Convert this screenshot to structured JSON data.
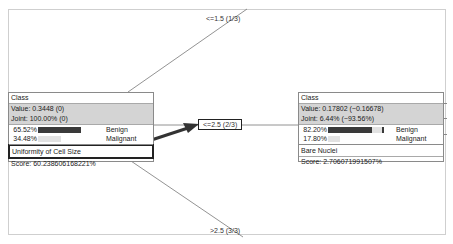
{
  "root_node": {
    "class_label": "Class",
    "value": "Value: 0.3448 (0)",
    "joint": "Joint: 100.00% (0)",
    "distribution": [
      {
        "pct": "65.52%",
        "label": "Benign",
        "fraction": 0.6552,
        "color": "#3a3a3a"
      },
      {
        "pct": "34.48%",
        "label": "Malignant",
        "fraction": 0.3448,
        "color": "#e2e2e2"
      }
    ],
    "split_attribute": "Uniformity of Cell Size",
    "score": "Score: 60.238606168221%"
  },
  "child_node": {
    "class_label": "Class",
    "value": "Value: 0.17802 (−0.16678)",
    "joint": "Joint: 6.44% (−93.56%)",
    "distribution": [
      {
        "pct": "82.20%",
        "label": "Benign",
        "fraction": 0.822,
        "color": "#3a3a3a"
      },
      {
        "pct": "17.80%",
        "label": "Malignant",
        "fraction": 0.178,
        "color": "#e2e2e2"
      }
    ],
    "split_attribute": "Bare Nuclei",
    "score": "Score: 2.706071991507%"
  },
  "edges": [
    {
      "label": "<=1.5 (1/3)",
      "selected": false
    },
    {
      "label": "<=2.5 (2/3)",
      "selected": true
    },
    {
      "label": ">2.5 (3/3)",
      "selected": false
    }
  ],
  "colors": {
    "header_shade": "#d4d4d4",
    "bar_dark": "#3a3a3a",
    "bar_light": "#e2e2e2",
    "arrow": "#333333"
  }
}
